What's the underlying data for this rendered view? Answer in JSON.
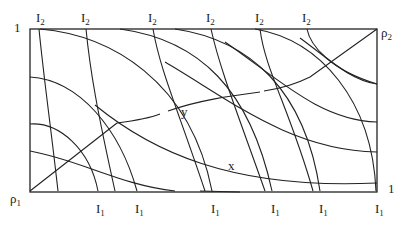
{
  "diagram": {
    "corner_labels": {
      "top_left": "1",
      "bottom_right": "1",
      "top_right": {
        "base": "ρ",
        "sub": "2"
      },
      "bottom_left": {
        "base": "ρ",
        "sub": "1"
      }
    },
    "top_labels": [
      {
        "base": "I",
        "sub": "2"
      },
      {
        "base": "I",
        "sub": "2"
      },
      {
        "base": "I",
        "sub": "2"
      },
      {
        "base": "I",
        "sub": "2"
      },
      {
        "base": "I",
        "sub": "2"
      },
      {
        "base": "I",
        "sub": "2"
      }
    ],
    "bottom_labels": [
      {
        "base": "I",
        "sub": "1"
      },
      {
        "base": "I",
        "sub": "1"
      },
      {
        "base": "I",
        "sub": "1"
      },
      {
        "base": "I",
        "sub": "1"
      },
      {
        "base": "I",
        "sub": "1"
      },
      {
        "base": "I",
        "sub": "1"
      }
    ],
    "point_labels": {
      "y": "y",
      "x": "x"
    }
  }
}
